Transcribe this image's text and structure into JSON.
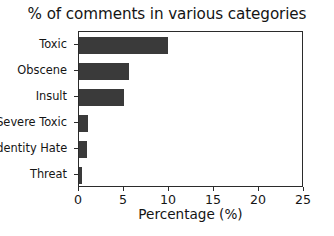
{
  "chart_data": {
    "type": "bar",
    "orientation": "horizontal",
    "title": "% of comments in various categories",
    "xlabel": "Percentage (%)",
    "ylabel": "",
    "categories": [
      "Toxic",
      "Obscene",
      "Insult",
      "Severe Toxic",
      "Identity Hate",
      "Threat"
    ],
    "values": [
      9.9,
      5.5,
      5.0,
      1.0,
      0.9,
      0.3
    ],
    "xlim": [
      0,
      25
    ],
    "xticks": [
      0,
      5,
      10,
      15,
      20,
      25
    ],
    "xtick_labels": [
      "0",
      "5",
      "10",
      "15",
      "20",
      "25"
    ],
    "grid": false,
    "legend": null,
    "bar_color": "#3a3a3a",
    "background_color": "#ffffff",
    "axis_color": "#2b2b2b"
  }
}
